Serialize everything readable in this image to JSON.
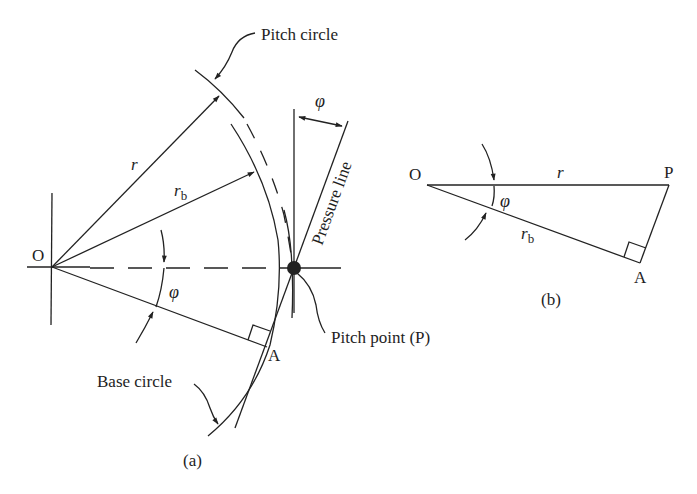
{
  "figure_a": {
    "caption": "(a)",
    "labels": {
      "center": "O",
      "radius": "r",
      "base_radius_main": "r",
      "base_radius_sub": "b",
      "angle_phi_center": "φ",
      "angle_phi_top": "φ",
      "tangent_point": "A",
      "pitch_circle": "Pitch circle",
      "base_circle": "Base circle",
      "pressure_line": "Pressure line",
      "pitch_point": "Pitch point (P)"
    }
  },
  "figure_b": {
    "caption": "(b)",
    "labels": {
      "vertex_o": "O",
      "vertex_p": "P",
      "vertex_a": "A",
      "hypotenuse": "r",
      "leg_main": "r",
      "leg_sub": "b",
      "angle_phi": "φ"
    }
  },
  "colors": {
    "stroke": "#222222",
    "background": "#ffffff"
  }
}
